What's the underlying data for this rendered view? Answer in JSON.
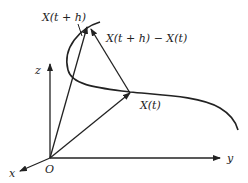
{
  "diagram": {
    "axes": {
      "z_label": "z",
      "y_label": "y",
      "x_label": "x",
      "origin_label": "O"
    },
    "points": {
      "x_t_label": "X(t)",
      "x_t_plus_h_label": "X(t + h)"
    },
    "difference_vector_label": "X(t + h) − X(t)",
    "colors": {
      "stroke": "#222222",
      "background": "#ffffff"
    }
  }
}
